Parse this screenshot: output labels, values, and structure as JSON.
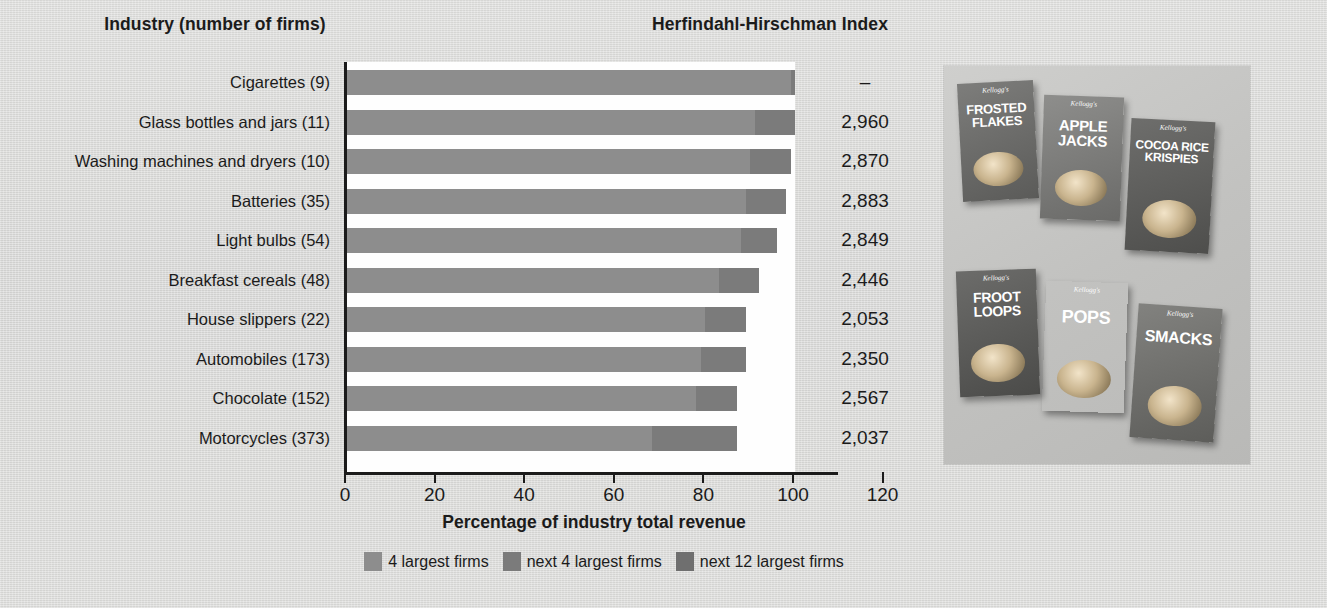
{
  "headers": {
    "industry": "Industry (number of firms)",
    "hhi": "Herfindahl-Hirschman Index"
  },
  "axis": {
    "x_title": "Percentage of industry total revenue",
    "ticks": [
      "0",
      "20",
      "40",
      "60",
      "80",
      "100",
      "120"
    ]
  },
  "legend": [
    {
      "label": "4 largest firms",
      "color": "#8d8d8d"
    },
    {
      "label": "next 4 largest firms",
      "color": "#7b7b7b"
    },
    {
      "label": "next 12 largest firms",
      "color": "#6f6f6f"
    }
  ],
  "rows": [
    {
      "label": "Cigarettes  (9)",
      "hhi": "–"
    },
    {
      "label": "Glass bottles and jars  (11)",
      "hhi": "2,960"
    },
    {
      "label": "Washing machines and dryers  (10)",
      "hhi": "2,870"
    },
    {
      "label": "Batteries  (35)",
      "hhi": "2,883"
    },
    {
      "label": "Light bulbs  (54)",
      "hhi": "2,849"
    },
    {
      "label": "Breakfast cereals  (48)",
      "hhi": "2,446"
    },
    {
      "label": "House slippers  (22)",
      "hhi": "2,053"
    },
    {
      "label": "Automobiles  (173)",
      "hhi": "2,350"
    },
    {
      "label": "Chocolate  (152)",
      "hhi": "2,567"
    },
    {
      "label": "Motorcycles  (373)",
      "hhi": "2,037"
    }
  ],
  "photo": {
    "boxes": [
      {
        "brand": "Kellogg's",
        "name": "FROSTED FLAKES"
      },
      {
        "brand": "Kellogg's",
        "name": "APPLE JACKS"
      },
      {
        "brand": "Kellogg's",
        "name": "COCOA RICE KRISPIES"
      },
      {
        "brand": "Kellogg's",
        "name": "FROOT LOOPS"
      },
      {
        "brand": "Kellogg's",
        "name": "POPS"
      },
      {
        "brand": "Kellogg's",
        "name": "SMACKS"
      }
    ]
  },
  "chart_data": {
    "type": "bar",
    "orientation": "horizontal",
    "stacked": true,
    "title": "",
    "xlabel": "Percentage of industry total revenue",
    "ylabel": "Industry (number of firms)",
    "xlim": [
      0,
      120
    ],
    "xticks": [
      0,
      20,
      40,
      60,
      80,
      100,
      120
    ],
    "grid": false,
    "legend_position": "bottom",
    "categories": [
      "Cigarettes  (9)",
      "Glass bottles and jars  (11)",
      "Washing machines and dryers  (10)",
      "Batteries  (35)",
      "Light bulbs  (54)",
      "Breakfast cereals  (48)",
      "House slippers  (22)",
      "Automobiles  (173)",
      "Chocolate  (152)",
      "Motorcycles  (373)"
    ],
    "series": [
      {
        "name": "4 largest firms",
        "values": [
          99,
          91,
          90,
          89,
          88,
          83,
          80,
          79,
          78,
          68
        ]
      },
      {
        "name": "next 4 largest firms",
        "values": [
          1,
          9,
          9,
          9,
          8,
          9,
          9,
          10,
          9,
          19
        ]
      },
      {
        "name": "next 12 largest firms",
        "values": [
          0,
          0,
          0,
          0,
          0,
          0,
          0,
          0,
          0,
          0
        ]
      }
    ],
    "totals": [
      100,
      100,
      99,
      98,
      96,
      92,
      89,
      89,
      87,
      87
    ],
    "annotations": {
      "column_header": "Herfindahl-Hirschman Index",
      "values": [
        "–",
        "2,960",
        "2,870",
        "2,883",
        "2,849",
        "2,446",
        "2,053",
        "2,350",
        "2,567",
        "2,037"
      ]
    }
  }
}
